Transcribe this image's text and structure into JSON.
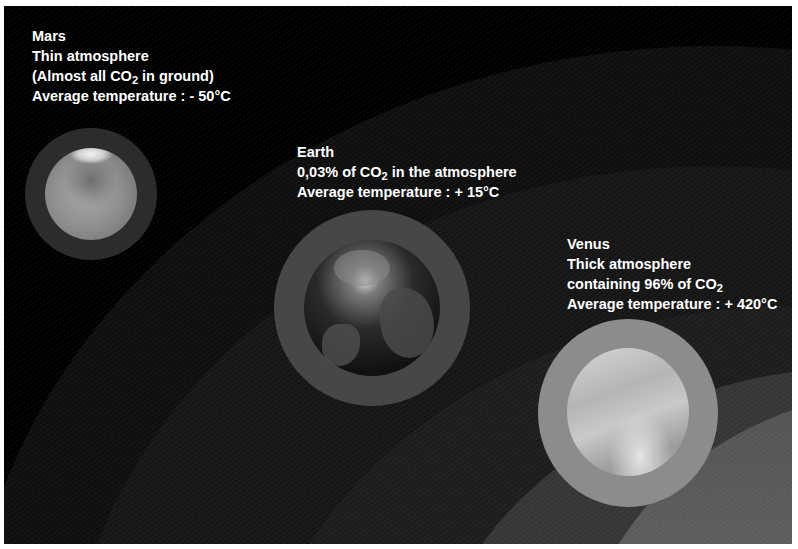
{
  "planets": [
    {
      "name": "Mars",
      "line1": "Mars",
      "line2": "Thin atmosphere",
      "line3_pre": "(Almost all CO",
      "line3_sub": "2",
      "line3_post": " in ground)",
      "line4": "Average temperature : - 50°C",
      "ring_color": "#2e2e2e",
      "surface_color": "#8c8c8c"
    },
    {
      "name": "Earth",
      "line1": "Earth",
      "line2_pre": "0,03% of CO",
      "line2_sub": "2",
      "line2_post": " in the atmosphere",
      "line3": "Average temperature : + 15°C",
      "ring_color": "#4a4a4a",
      "surface_color": "#1c1c1c"
    },
    {
      "name": "Venus",
      "line1": "Venus",
      "line2": "Thick atmosphere",
      "line3_pre": "containing 96% of CO",
      "line3_sub": "2",
      "line4": "Average temperature : + 420°C",
      "ring_color": "#8e8e8e",
      "surface_color": "#bdbdbd"
    }
  ],
  "colors": {
    "background": "#000000",
    "text": "#ffffff"
  }
}
